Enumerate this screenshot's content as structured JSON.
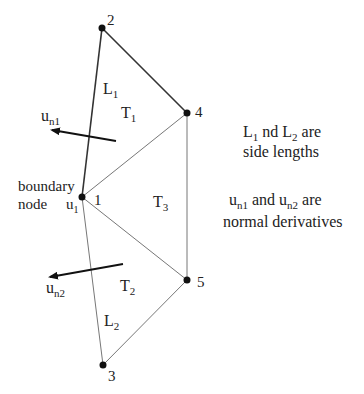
{
  "diagram": {
    "nodes": [
      {
        "id": "1",
        "label": "1",
        "x": 82,
        "y": 197
      },
      {
        "id": "2",
        "label": "2",
        "x": 102,
        "y": 28
      },
      {
        "id": "3",
        "label": "3",
        "x": 103,
        "y": 365
      },
      {
        "id": "4",
        "label": "4",
        "x": 187,
        "y": 113
      },
      {
        "id": "5",
        "label": "5",
        "x": 187,
        "y": 280
      }
    ],
    "triangles": [
      {
        "id": "T1",
        "label": "T",
        "sub": "1",
        "nodes": [
          "1",
          "2",
          "4"
        ]
      },
      {
        "id": "T2",
        "label": "T",
        "sub": "2",
        "nodes": [
          "1",
          "3",
          "5"
        ]
      },
      {
        "id": "T3",
        "label": "T",
        "sub": "3",
        "nodes": [
          "1",
          "4",
          "5"
        ]
      }
    ],
    "side_labels": [
      {
        "label": "L",
        "sub": "1"
      },
      {
        "label": "L",
        "sub": "2"
      }
    ],
    "normals": [
      {
        "label": "u",
        "sub": "n1"
      },
      {
        "label": "u",
        "sub": "n2"
      }
    ],
    "boundary_node": {
      "line1": "boundary",
      "line2": "node",
      "value": "u",
      "value_sub": "1"
    },
    "notes": {
      "note1_line1_parts": [
        "L",
        "1",
        " nd L",
        "2",
        " are"
      ],
      "note1_line2": "side lengths",
      "note2_line1_parts": [
        "u",
        "n1",
        " and u",
        "n2",
        " are"
      ],
      "note2_line2": "normal derivatives"
    },
    "colors": {
      "edge_dark": "#222222",
      "edge_light": "#777777",
      "node": "#111111"
    }
  }
}
